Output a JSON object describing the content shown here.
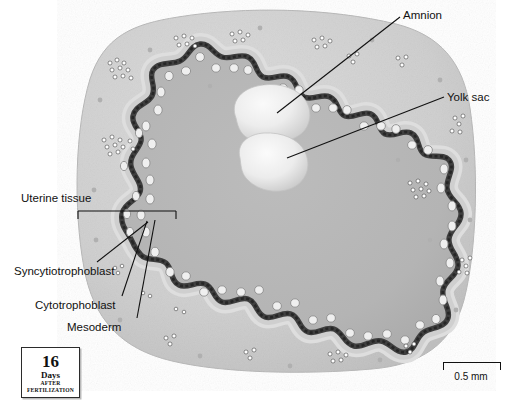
{
  "figure": {
    "stage_age": {
      "number": "16",
      "unit": "Days",
      "line1": "AFTER",
      "line2": "FERTILIZATION"
    },
    "scale": {
      "length_label": "0.5 mm"
    }
  },
  "labels": {
    "amnion": "Amnion",
    "yolk_sac": "Yolk sac",
    "uterine_tissue": "Uterine tissue",
    "syncytiotrophoblast": "Syncytiotrophoblast",
    "cytotrophoblast": "Cytotrophoblast",
    "mesoderm": "Mesoderm"
  },
  "colors": {
    "background": "#ffffff",
    "uterine_tissue": "#d2d2d2",
    "chorionic_cavity": "#b4b4b4",
    "syncytiotrophoblast": "#4a4a4a",
    "cytotrophoblast": "#c9c9c9",
    "vesicle_light": "#ededed",
    "leader_line": "#111111",
    "text": "#111111"
  },
  "structures": [
    {
      "name": "amnion",
      "kind": "vesicle",
      "label": "Amnion"
    },
    {
      "name": "yolk-sac",
      "kind": "vesicle",
      "label": "Yolk sac"
    },
    {
      "name": "uterine-tissue",
      "kind": "tissue-mass",
      "label": "Uterine tissue"
    },
    {
      "name": "syncytiotrophoblast",
      "kind": "dark-band",
      "label": "Syncytiotrophoblast"
    },
    {
      "name": "cytotrophoblast",
      "kind": "cell-layer",
      "label": "Cytotrophoblast"
    },
    {
      "name": "mesoderm",
      "kind": "thin-layer",
      "label": "Mesoderm"
    },
    {
      "name": "maternal-blood-lacunae",
      "kind": "speckle-cluster",
      "label": ""
    }
  ]
}
